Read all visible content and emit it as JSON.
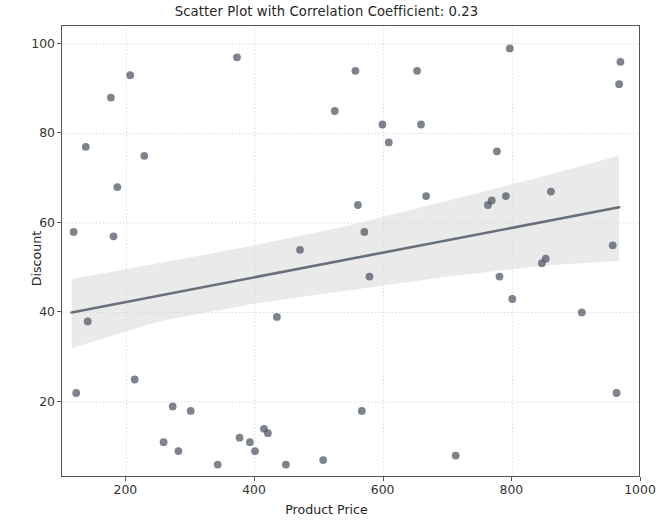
{
  "chart_data": {
    "type": "scatter",
    "title": "Scatter Plot with Correlation Coefficient: 0.23",
    "correlation_coefficient": 0.23,
    "xlabel": "Product Price",
    "ylabel": "Discount",
    "xlim": [
      100,
      1000
    ],
    "ylim": [
      3,
      104
    ],
    "xticks": [
      200,
      400,
      600,
      800,
      1000
    ],
    "yticks": [
      20,
      40,
      60,
      80,
      100
    ],
    "grid": true,
    "legend": null,
    "marker_color": "#4c5563",
    "line_color": "#4c5563",
    "band_color": "#d8d8d8",
    "points": [
      {
        "x": 118,
        "y": 58
      },
      {
        "x": 122,
        "y": 22
      },
      {
        "x": 137,
        "y": 77
      },
      {
        "x": 140,
        "y": 38
      },
      {
        "x": 176,
        "y": 88
      },
      {
        "x": 180,
        "y": 57
      },
      {
        "x": 186,
        "y": 68
      },
      {
        "x": 206,
        "y": 93
      },
      {
        "x": 213,
        "y": 25
      },
      {
        "x": 228,
        "y": 75
      },
      {
        "x": 258,
        "y": 11
      },
      {
        "x": 272,
        "y": 19
      },
      {
        "x": 281,
        "y": 9
      },
      {
        "x": 300,
        "y": 18
      },
      {
        "x": 342,
        "y": 6
      },
      {
        "x": 372,
        "y": 97
      },
      {
        "x": 376,
        "y": 12
      },
      {
        "x": 392,
        "y": 11
      },
      {
        "x": 400,
        "y": 9
      },
      {
        "x": 414,
        "y": 14
      },
      {
        "x": 420,
        "y": 13
      },
      {
        "x": 434,
        "y": 39
      },
      {
        "x": 448,
        "y": 6
      },
      {
        "x": 470,
        "y": 54
      },
      {
        "x": 506,
        "y": 7
      },
      {
        "x": 524,
        "y": 85
      },
      {
        "x": 556,
        "y": 94
      },
      {
        "x": 560,
        "y": 64
      },
      {
        "x": 566,
        "y": 18
      },
      {
        "x": 570,
        "y": 58
      },
      {
        "x": 578,
        "y": 48
      },
      {
        "x": 598,
        "y": 82
      },
      {
        "x": 608,
        "y": 78
      },
      {
        "x": 652,
        "y": 94
      },
      {
        "x": 658,
        "y": 82
      },
      {
        "x": 666,
        "y": 66
      },
      {
        "x": 712,
        "y": 8
      },
      {
        "x": 762,
        "y": 64
      },
      {
        "x": 768,
        "y": 65
      },
      {
        "x": 776,
        "y": 76
      },
      {
        "x": 780,
        "y": 48
      },
      {
        "x": 790,
        "y": 66
      },
      {
        "x": 796,
        "y": 99
      },
      {
        "x": 800,
        "y": 43
      },
      {
        "x": 846,
        "y": 51
      },
      {
        "x": 852,
        "y": 52
      },
      {
        "x": 860,
        "y": 67
      },
      {
        "x": 908,
        "y": 40
      },
      {
        "x": 956,
        "y": 55
      },
      {
        "x": 962,
        "y": 22
      },
      {
        "x": 966,
        "y": 91
      },
      {
        "x": 968,
        "y": 96
      }
    ],
    "regression_line": {
      "x_start": 115,
      "y_start": 40.0,
      "x_end": 966,
      "y_end": 63.5
    },
    "confidence_band": {
      "upper": [
        {
          "x": 115,
          "y": 47.5
        },
        {
          "x": 250,
          "y": 51.0
        },
        {
          "x": 400,
          "y": 55.0
        },
        {
          "x": 550,
          "y": 59.5
        },
        {
          "x": 700,
          "y": 65.0
        },
        {
          "x": 850,
          "y": 70.5
        },
        {
          "x": 966,
          "y": 75.0
        }
      ],
      "lower": [
        {
          "x": 115,
          "y": 32.0
        },
        {
          "x": 250,
          "y": 38.0
        },
        {
          "x": 400,
          "y": 42.0
        },
        {
          "x": 550,
          "y": 45.0
        },
        {
          "x": 700,
          "y": 48.0
        },
        {
          "x": 850,
          "y": 50.5
        },
        {
          "x": 966,
          "y": 51.5
        }
      ]
    }
  }
}
